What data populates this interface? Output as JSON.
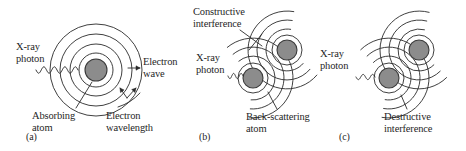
{
  "figure": {
    "background_color": "#ffffff",
    "line_color": "#2a2a2a",
    "atom_fill_color": "#8c8c8c",
    "atom_ring_color": "#3a3a3a"
  },
  "panels": [
    {
      "id": "a",
      "caption": "(a)",
      "caption_x": 26,
      "caption_y": 131,
      "labels": [
        {
          "name": "xray-photon-label-a",
          "text": "X-ray\nphoton",
          "x": 16,
          "y": 41
        },
        {
          "name": "electron-wave-label-a",
          "text": "Electron\nwave",
          "x": 143,
          "y": 56
        },
        {
          "name": "absorbing-atom-label-a",
          "text": "Absorbing\natom",
          "x": 32,
          "y": 110
        },
        {
          "name": "electron-wavelength-label-a",
          "text": "Electron\nwavelength",
          "x": 106,
          "y": 110
        }
      ],
      "atoms": [
        {
          "name": "absorbing-atom",
          "cx": 96,
          "cy": 70,
          "core_r": 11,
          "shell_r": 17
        }
      ],
      "outer_rings": [
        26,
        36,
        46
      ],
      "photon": {
        "x_start": 36,
        "x_end": 78,
        "y": 70,
        "cycles": 4,
        "amplitude": 3.2
      }
    },
    {
      "id": "b",
      "caption": "(b)",
      "caption_x": 199,
      "caption_y": 131,
      "labels": [
        {
          "name": "constructive-interference-label",
          "text": "Constructive\ninterference",
          "x": 193,
          "y": 6
        },
        {
          "name": "xray-photon-label-b",
          "text": "X-ray\nphoton",
          "x": 196,
          "y": 52
        },
        {
          "name": "back-scattering-atom-label",
          "text": "Back-scattering\natom",
          "x": 246,
          "y": 111
        }
      ],
      "atoms": [
        {
          "name": "absorbing-atom-b",
          "cx": 253,
          "cy": 78,
          "core_r": 10,
          "shell_r": 15
        },
        {
          "name": "back-scattering-atom-b",
          "cx": 287,
          "cy": 50,
          "core_r": 10,
          "shell_r": 15
        }
      ],
      "photon": {
        "x_start": 228,
        "x_end": 243,
        "y": 76,
        "cycles": 2,
        "amplitude": 2.6
      }
    },
    {
      "id": "c",
      "caption": "(c)",
      "caption_x": 339,
      "caption_y": 131,
      "labels": [
        {
          "name": "xray-photon-label-c",
          "text": "X-ray\nphoton",
          "x": 320,
          "y": 48
        },
        {
          "name": "destructive-interference-label",
          "text": "Destructive\ninterference",
          "x": 384,
          "y": 111
        }
      ],
      "atoms": [
        {
          "name": "absorbing-atom-c",
          "cx": 389,
          "cy": 78,
          "core_r": 10,
          "shell_r": 15
        },
        {
          "name": "back-scattering-atom-c",
          "cx": 419,
          "cy": 50,
          "core_r": 10,
          "shell_r": 15
        }
      ],
      "photon": {
        "x_start": 356,
        "x_end": 375,
        "y": 77,
        "cycles": 2,
        "amplitude": 2.6
      }
    }
  ]
}
